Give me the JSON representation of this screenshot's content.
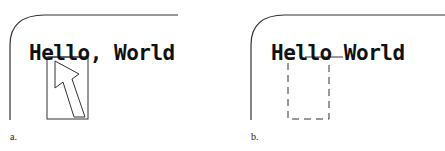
{
  "figure": {
    "panels": [
      {
        "id": "a",
        "caption": "a.",
        "window_text": "Hello, World",
        "selection_style": "solid",
        "cursor": "arrow-pointer"
      },
      {
        "id": "b",
        "caption": "b.",
        "window_text": "Hello World",
        "selection_style": "dashed",
        "cursor": "none"
      }
    ],
    "colors": {
      "stroke": "#333333",
      "text": "#111111",
      "background": "#ffffff"
    }
  }
}
